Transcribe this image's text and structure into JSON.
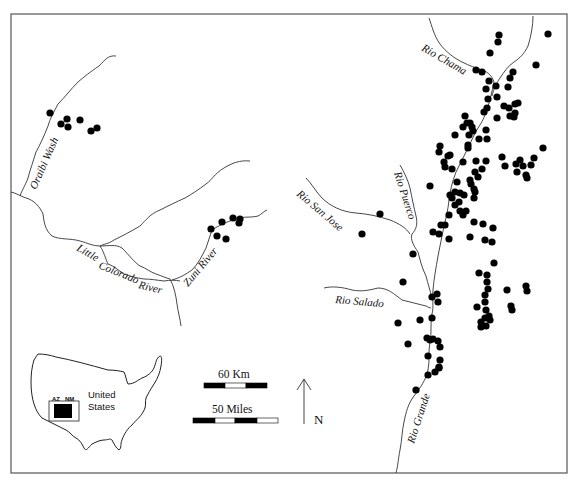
{
  "map": {
    "frame": {
      "x": 11,
      "y": 14,
      "width": 556,
      "height": 459
    },
    "river_labels": [
      {
        "id": "oraibi-wash",
        "text": "Oraibi Wash",
        "x": 36,
        "y": 190,
        "rotate": -66
      },
      {
        "id": "little-colorado",
        "text": "Little",
        "x": 76,
        "y": 250,
        "rotate": 30
      },
      {
        "id": "little-colorado-2",
        "text": "Colorado",
        "x": 100,
        "y": 270,
        "rotate": 22
      },
      {
        "id": "little-colorado-3",
        "text": "River",
        "x": 136,
        "y": 289,
        "rotate": 14
      },
      {
        "id": "zuni-river",
        "text": "Zuni River",
        "x": 187,
        "y": 287,
        "rotate": -50
      },
      {
        "id": "rio-chama",
        "text": "Rio Chama",
        "x": 421,
        "y": 50,
        "rotate": 30
      },
      {
        "id": "rio-puerco",
        "text": "Rio Puerco",
        "x": 392,
        "y": 175,
        "rotate": 72
      },
      {
        "id": "rio-san-jose",
        "text": "Rio San Jose",
        "x": 296,
        "y": 195,
        "rotate": 40
      },
      {
        "id": "rio-salado",
        "text": "Rio Salado",
        "x": 335,
        "y": 302,
        "rotate": 5
      },
      {
        "id": "rio-grande",
        "text": "Rio Grande",
        "x": 414,
        "y": 444,
        "rotate": -72
      }
    ],
    "inset": {
      "country_label_line1": "United",
      "country_label_line2": "States",
      "state_labels": [
        "AZ",
        "NM"
      ]
    },
    "scale_bars": {
      "km_label": "60 Km",
      "miles_label": "50 Miles"
    },
    "north_arrow": {
      "label": "N"
    },
    "sites": [
      [
        50,
        113
      ],
      [
        61,
        124
      ],
      [
        67,
        119
      ],
      [
        68,
        127
      ],
      [
        80,
        120
      ],
      [
        91,
        131
      ],
      [
        97,
        128
      ],
      [
        211,
        229
      ],
      [
        222,
        222
      ],
      [
        233,
        218
      ],
      [
        239,
        223
      ],
      [
        240,
        219
      ],
      [
        217,
        236
      ],
      [
        226,
        239
      ],
      [
        499,
        35
      ],
      [
        498,
        42
      ],
      [
        490,
        53
      ],
      [
        548,
        34
      ],
      [
        536,
        65
      ],
      [
        476,
        70
      ],
      [
        482,
        72
      ],
      [
        489,
        81
      ],
      [
        496,
        86
      ],
      [
        510,
        78
      ],
      [
        513,
        72
      ],
      [
        508,
        87
      ],
      [
        486,
        89
      ],
      [
        488,
        99
      ],
      [
        497,
        97
      ],
      [
        487,
        108
      ],
      [
        484,
        112
      ],
      [
        504,
        106
      ],
      [
        509,
        108
      ],
      [
        515,
        104
      ],
      [
        518,
        103
      ],
      [
        515,
        113
      ],
      [
        514,
        117
      ],
      [
        510,
        116
      ],
      [
        497,
        118
      ],
      [
        465,
        116
      ],
      [
        467,
        123
      ],
      [
        470,
        123
      ],
      [
        463,
        127
      ],
      [
        472,
        127
      ],
      [
        469,
        135
      ],
      [
        473,
        131
      ],
      [
        455,
        135
      ],
      [
        486,
        130
      ],
      [
        487,
        139
      ],
      [
        479,
        139
      ],
      [
        468,
        145
      ],
      [
        486,
        161
      ],
      [
        476,
        161
      ],
      [
        482,
        169
      ],
      [
        475,
        172
      ],
      [
        478,
        177
      ],
      [
        470,
        180
      ],
      [
        474,
        189
      ],
      [
        464,
        195
      ],
      [
        460,
        193
      ],
      [
        459,
        202
      ],
      [
        460,
        211
      ],
      [
        463,
        215
      ],
      [
        471,
        184
      ],
      [
        475,
        192
      ],
      [
        474,
        198
      ],
      [
        448,
        156
      ],
      [
        439,
        152
      ],
      [
        444,
        162
      ],
      [
        445,
        167
      ],
      [
        452,
        169
      ],
      [
        450,
        155
      ],
      [
        430,
        186
      ],
      [
        440,
        146
      ],
      [
        463,
        162
      ],
      [
        468,
        148
      ],
      [
        505,
        166
      ],
      [
        502,
        157
      ],
      [
        517,
        172
      ],
      [
        523,
        166
      ],
      [
        531,
        165
      ],
      [
        534,
        158
      ],
      [
        543,
        148
      ],
      [
        516,
        164
      ],
      [
        520,
        160
      ],
      [
        526,
        175
      ],
      [
        527,
        178
      ],
      [
        457,
        182
      ],
      [
        455,
        205
      ],
      [
        449,
        215
      ],
      [
        450,
        195
      ],
      [
        452,
        198
      ],
      [
        455,
        192
      ],
      [
        466,
        211
      ],
      [
        474,
        222
      ],
      [
        470,
        237
      ],
      [
        483,
        224
      ],
      [
        485,
        240
      ],
      [
        493,
        228
      ],
      [
        492,
        242
      ],
      [
        494,
        263
      ],
      [
        479,
        273
      ],
      [
        485,
        295
      ],
      [
        488,
        289
      ],
      [
        487,
        282
      ],
      [
        487,
        275
      ],
      [
        507,
        290
      ],
      [
        526,
        286
      ],
      [
        527,
        291
      ],
      [
        511,
        306
      ],
      [
        512,
        310
      ],
      [
        489,
        316
      ],
      [
        490,
        320
      ],
      [
        481,
        322
      ],
      [
        481,
        327
      ],
      [
        485,
        318
      ],
      [
        486,
        310
      ],
      [
        485,
        302
      ],
      [
        477,
        307
      ],
      [
        486,
        326
      ],
      [
        445,
        225
      ],
      [
        441,
        225
      ],
      [
        439,
        234
      ],
      [
        449,
        239
      ],
      [
        433,
        232
      ],
      [
        413,
        254
      ],
      [
        432,
        297
      ],
      [
        437,
        294
      ],
      [
        438,
        302
      ],
      [
        432,
        318
      ],
      [
        408,
        344
      ],
      [
        420,
        320
      ],
      [
        380,
        214
      ],
      [
        362,
        234
      ],
      [
        403,
        282
      ],
      [
        398,
        323
      ],
      [
        427,
        338
      ],
      [
        430,
        340
      ],
      [
        433,
        339
      ],
      [
        438,
        341
      ],
      [
        440,
        347
      ],
      [
        440,
        360
      ],
      [
        439,
        368
      ],
      [
        428,
        356
      ],
      [
        428,
        375
      ],
      [
        435,
        372
      ],
      [
        439,
        367
      ],
      [
        416,
        390
      ]
    ]
  }
}
